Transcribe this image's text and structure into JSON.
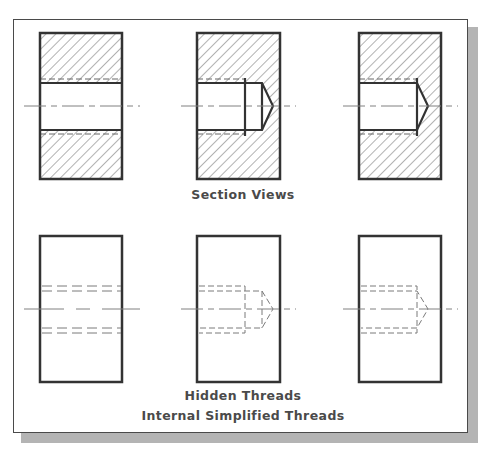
{
  "figure": {
    "title": "Internal Simplified Threads",
    "section_label": "Section Views",
    "hidden_label": "Hidden Threads",
    "caption": "Internal Simplified Threads"
  },
  "rows": [
    {
      "name": "Section Views",
      "views": [
        {
          "type": "section",
          "hole": "through",
          "description": "Through threaded hole, section view"
        },
        {
          "type": "section",
          "hole": "blind-drill-longer",
          "description": "Blind threaded hole with drill depth beyond thread, section view"
        },
        {
          "type": "section",
          "hole": "blind-bottomed",
          "description": "Bottomed threaded hole, section view"
        }
      ]
    },
    {
      "name": "Hidden Threads",
      "views": [
        {
          "type": "hidden",
          "hole": "through",
          "description": "Through threaded hole, hidden lines"
        },
        {
          "type": "hidden",
          "hole": "blind-drill-longer",
          "description": "Blind threaded hole with drill depth beyond thread, hidden lines"
        },
        {
          "type": "hidden",
          "hole": "blind-bottomed",
          "description": "Bottomed threaded hole, hidden lines"
        }
      ]
    }
  ],
  "colors": {
    "object_line": "#333333",
    "hatch": "#555555",
    "hidden_line": "#7a7a7a",
    "center_line": "#808080",
    "frame": "#4a4a4a",
    "shadow": "#b4b4b4",
    "text": "#4a4a4a"
  }
}
